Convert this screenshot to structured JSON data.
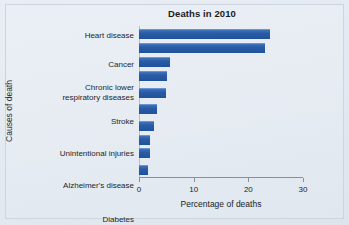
{
  "chart_data": {
    "type": "bar",
    "orientation": "horizontal",
    "title": "Deaths in 2010",
    "xlabel": "Percentage of deaths",
    "ylabel": "Causes of death",
    "xlim": [
      0,
      30
    ],
    "xticks": [
      0,
      10,
      20,
      30
    ],
    "xtick_labels": [
      "0",
      "10",
      "20",
      "30"
    ],
    "grid": false,
    "legend": null,
    "bar_color": "#2b5ba6",
    "categories": [
      "Heart disease",
      "Cancer",
      "Chronic lower\nrespiratory diseases",
      "Stroke",
      "Unintentional injuries",
      "Alzheimer's disease",
      "Diabetes",
      "Nephritis, nephrotic\nsyndrome, and nephrosis",
      "Influenza and pneumonia",
      "Suicide"
    ],
    "values": [
      24.0,
      23.0,
      5.6,
      5.2,
      5.0,
      3.3,
      2.8,
      2.0,
      2.0,
      1.6
    ]
  },
  "figure": {
    "background": "#e6ecf2",
    "frame_color": "#cdd6e0",
    "axis_color": "#8d8f93"
  }
}
